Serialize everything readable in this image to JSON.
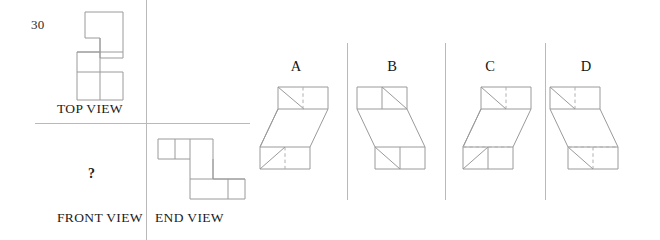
{
  "question": {
    "number": "30",
    "missing_view_marker": "?"
  },
  "orthographic_panel": {
    "labels": {
      "top_view": "TOP VIEW",
      "front_view": "FRONT VIEW",
      "end_view": "END VIEW"
    },
    "front_view_content": "?",
    "top_view_shape": {
      "type": "z-shaped-polygon",
      "outline_points": "63,12 123,12 123,100 63,100",
      "description": "stepped Z outline with interior division lines"
    },
    "end_view_shape": {
      "type": "z-shaped-polygon",
      "description": "two cells upper-left, vertical connector, two cells lower-right"
    },
    "dividers": {
      "vertical_x": 146,
      "horizontal_y": 123
    }
  },
  "options": [
    {
      "letter": "A",
      "diagonal": "top-left-to-bottom-right",
      "hidden_line_style": "dashed",
      "description": "isometric Z block, diagonal descending left-to-right"
    },
    {
      "letter": "B",
      "diagonal": "top-right-to-bottom-left",
      "hidden_line_style": "solid",
      "description": "isometric Z block, mirrored diagonal"
    },
    {
      "letter": "C",
      "diagonal": "top-left-to-bottom-right",
      "hidden_line_style": "dashed",
      "description": "isometric Z block, reversed slant direction"
    },
    {
      "letter": "D",
      "diagonal": "top-left-to-bottom-right",
      "hidden_line_style": "dashed",
      "description": "isometric Z block, offset to the right"
    }
  ],
  "colors": {
    "line": "#9a9a9a",
    "rule": "#b9b9b9",
    "text": "#1a1a1a",
    "background": "#ffffff"
  }
}
